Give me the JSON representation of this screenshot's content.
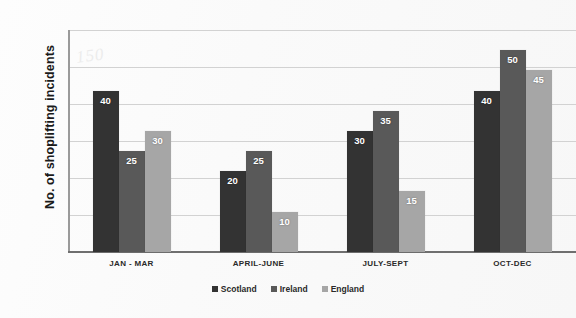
{
  "chart_data": {
    "type": "bar",
    "title": "",
    "xlabel": "",
    "ylabel": "No. of shoplifting incidents",
    "categories": [
      "JAN - MAR",
      "APRIL-JUNE",
      "JULY-SEPT",
      "OCT-DEC"
    ],
    "series": [
      {
        "name": "Scotland",
        "color": "#333333",
        "values": [
          40,
          20,
          30,
          40
        ]
      },
      {
        "name": "Ireland",
        "color": "#595959",
        "values": [
          25,
          25,
          35,
          50
        ]
      },
      {
        "name": "England",
        "color": "#a6a6a6",
        "values": [
          30,
          10,
          15,
          45
        ]
      }
    ],
    "ylim": [
      0,
      55
    ],
    "y_tick_labels": [],
    "gridlines": {
      "horizontal": true,
      "vertical": false,
      "count": 6
    },
    "legend_position": "bottom",
    "data_labels": true,
    "annotations": [
      {
        "text": "150",
        "note": "faint handwritten mark near top-left of plot"
      }
    ]
  },
  "legend": {
    "items": [
      {
        "label": "Scotland",
        "color": "#333333"
      },
      {
        "label": "Ireland",
        "color": "#595959"
      },
      {
        "label": "England",
        "color": "#a6a6a6"
      }
    ]
  },
  "watermark": {
    "text": "150"
  }
}
